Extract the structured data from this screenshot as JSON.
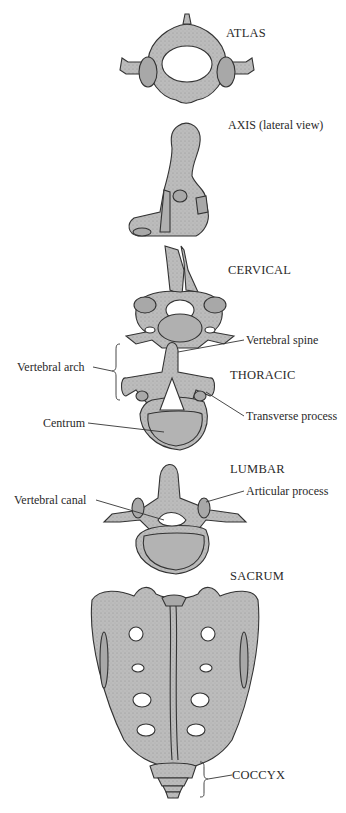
{
  "figure": {
    "sections": [
      {
        "id": "atlas",
        "label": "ATLAS"
      },
      {
        "id": "axis",
        "label": "AXIS (lateral view)"
      },
      {
        "id": "cervical",
        "label": "CERVICAL"
      },
      {
        "id": "thoracic",
        "label": "THORACIC"
      },
      {
        "id": "lumbar",
        "label": "LUMBAR"
      },
      {
        "id": "sacrum",
        "label": "SACRUM"
      },
      {
        "id": "coccyx",
        "label": "COCCYX"
      }
    ],
    "annotations": {
      "vertebral_spine": "Vertebral spine",
      "vertebral_arch": "Vertebral arch",
      "transverse_process": "Transverse process",
      "centrum": "Centrum",
      "vertebral_canal": "Vertebral canal",
      "articular_process": "Articular process"
    },
    "colors": {
      "bone_fill": "#b9b9b9",
      "bone_stroke": "#333333",
      "hole_fill": "#ffffff",
      "leader_line": "#333333"
    }
  }
}
